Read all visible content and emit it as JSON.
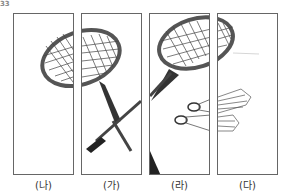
{
  "question_number": "33",
  "panels": [
    {
      "label": "(나)",
      "x": 13
    },
    {
      "label": "(가)",
      "x": 81
    },
    {
      "label": "(라)",
      "x": 149
    },
    {
      "label": "(다)",
      "x": 217
    }
  ],
  "image_subject": "badminton rackets and shuttlecocks split into four panels"
}
